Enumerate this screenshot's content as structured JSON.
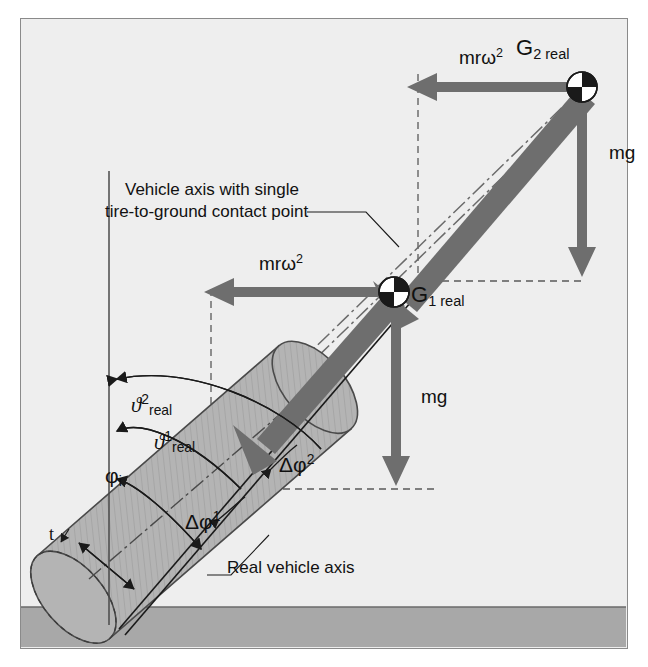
{
  "figure": {
    "background_color": "#eeeeee",
    "frame_color": "#8a8a8a",
    "ground_color": "#a8a8a8",
    "body_fill": "#b4b4b4",
    "arrow_color": "#6e6e6e",
    "line_color": "#1a1a1a"
  },
  "annotations": {
    "callout_axis_line1": "Vehicle axis with single",
    "callout_axis_line2": "tire-to-ground contact point",
    "callout_real_axis": "Real vehicle axis",
    "thickness_label": "t"
  },
  "forces": [
    {
      "name": "centrifugal-upper",
      "label_base": "mr",
      "label_omega": "ω",
      "label_exp": "2",
      "direction": "left",
      "at": "G2real"
    },
    {
      "name": "gravity-upper",
      "label": "mg",
      "direction": "down",
      "at": "G2real"
    },
    {
      "name": "centrifugal-lower",
      "label_base": "mr",
      "label_omega": "ω",
      "label_exp": "2",
      "direction": "left",
      "at": "G1real"
    },
    {
      "name": "gravity-lower",
      "label": "mg",
      "direction": "down",
      "at": "G1real"
    }
  ],
  "mass_centers": [
    {
      "name": "G2real",
      "symbol": "G",
      "subscript": "2 real"
    },
    {
      "name": "G1real",
      "symbol": "G",
      "subscript": "1 real"
    }
  ],
  "angles": [
    {
      "name": "theta2-real",
      "symbol": "ϑ",
      "superscript": "2",
      "subscript": "real"
    },
    {
      "name": "theta1-real",
      "symbol": "ϑ",
      "superscript": "1",
      "subscript": "real"
    },
    {
      "name": "phi-i",
      "symbol": "φ",
      "superscript": "",
      "subscript": "i"
    },
    {
      "name": "delta-phi-2",
      "symbol": "Δφ",
      "superscript": "2",
      "subscript": ""
    },
    {
      "name": "delta-phi-1",
      "symbol": "Δφ",
      "superscript": "1",
      "subscript": ""
    }
  ]
}
